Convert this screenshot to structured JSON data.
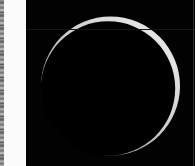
{
  "image": {
    "subject": "thin backlit crescent of a spherical body on black background",
    "colors": {
      "background": "#020202",
      "crescent_bright": "#e2e2e2",
      "crescent_dim": "#8a8a8a",
      "margin": "#fbfbfb"
    }
  }
}
